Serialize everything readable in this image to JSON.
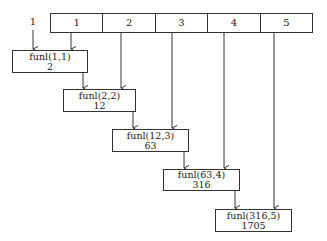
{
  "diagram": {
    "initial_input": "1",
    "array": {
      "cells": [
        "1",
        "2",
        "3",
        "4",
        "5"
      ]
    },
    "calls": [
      {
        "call": "funl(1,1)",
        "result": "2"
      },
      {
        "call": "funl(2,2)",
        "result": "12"
      },
      {
        "call": "funl(12,3)",
        "result": "63"
      },
      {
        "call": "funl(63,4)",
        "result": "316"
      },
      {
        "call": "funl(316,5)",
        "result": "1705"
      }
    ],
    "colors": {
      "stroke": "#333333",
      "background": "#ffffff",
      "text": "#222222"
    }
  }
}
